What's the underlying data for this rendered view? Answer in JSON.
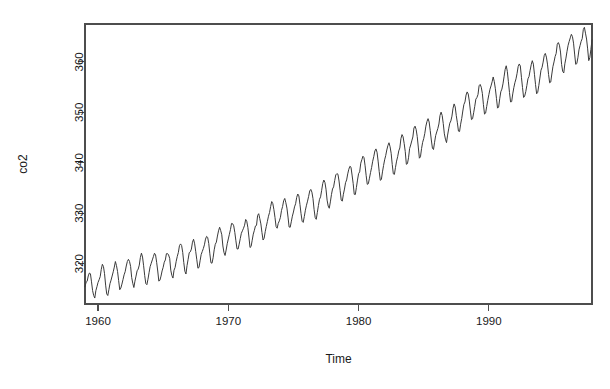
{
  "chart_data": {
    "type": "line",
    "title": "",
    "subtitle": "",
    "xlabel": "Time",
    "ylabel": "co2",
    "xlim": [
      1959.0,
      1997.917
    ],
    "ylim": [
      312.0,
      367.5
    ],
    "xticks": [
      1960,
      1970,
      1980,
      1990
    ],
    "xtick_labels": [
      "1960",
      "1970",
      "1980",
      "1990"
    ],
    "yticks": [
      320,
      330,
      340,
      350,
      360
    ],
    "ytick_labels": [
      "320",
      "330",
      "340",
      "350",
      "360"
    ],
    "grid": false,
    "legend": "none",
    "series_name": "co2",
    "series_color": "#3a3a3a",
    "frequency": "monthly",
    "x_start": 1959.0,
    "x_step": 0.0833333,
    "n_points": 468,
    "units": "ppm",
    "values": [
      315.42,
      316.31,
      316.5,
      317.56,
      318.13,
      318.0,
      316.39,
      314.65,
      313.68,
      313.18,
      314.66,
      315.43,
      316.27,
      316.81,
      317.42,
      318.87,
      319.87,
      319.43,
      318.01,
      315.74,
      314.0,
      313.68,
      314.84,
      316.03,
      316.73,
      317.54,
      318.38,
      319.31,
      320.42,
      319.61,
      318.42,
      316.63,
      314.83,
      315.16,
      315.94,
      316.85,
      317.78,
      318.4,
      319.53,
      320.42,
      320.85,
      320.45,
      319.45,
      317.25,
      316.11,
      315.27,
      316.53,
      317.53,
      318.58,
      318.92,
      319.7,
      321.22,
      322.08,
      321.31,
      319.58,
      317.61,
      316.05,
      315.83,
      316.91,
      318.2,
      319.41,
      320.07,
      320.74,
      321.4,
      322.06,
      321.73,
      320.27,
      318.54,
      316.54,
      316.71,
      317.53,
      318.55,
      319.27,
      320.28,
      320.73,
      321.97,
      322.0,
      321.71,
      321.05,
      318.71,
      317.66,
      317.14,
      318.7,
      319.25,
      320.46,
      321.43,
      322.23,
      323.54,
      323.91,
      323.59,
      322.24,
      320.2,
      318.48,
      317.94,
      319.63,
      320.87,
      322.17,
      322.34,
      322.88,
      324.25,
      324.83,
      323.93,
      322.38,
      320.76,
      319.1,
      319.24,
      320.56,
      321.8,
      322.4,
      322.99,
      323.73,
      324.86,
      325.4,
      325.2,
      323.98,
      321.95,
      320.18,
      320.09,
      321.16,
      322.74,
      323.83,
      324.26,
      325.47,
      326.5,
      327.21,
      326.54,
      325.72,
      323.5,
      322.22,
      321.62,
      322.69,
      323.95,
      324.89,
      325.82,
      326.77,
      327.97,
      327.91,
      327.5,
      326.18,
      324.53,
      322.93,
      322.9,
      323.85,
      324.96,
      326.01,
      326.51,
      327.01,
      327.62,
      328.76,
      328.4,
      327.2,
      325.27,
      323.2,
      323.4,
      324.63,
      325.85,
      326.6,
      327.47,
      327.58,
      329.56,
      329.9,
      328.92,
      327.88,
      326.16,
      324.68,
      325.04,
      326.34,
      327.39,
      328.37,
      329.4,
      330.14,
      331.33,
      332.31,
      331.9,
      330.7,
      329.15,
      327.35,
      327.02,
      327.99,
      328.48,
      329.18,
      330.55,
      331.32,
      332.48,
      332.92,
      332.08,
      331.01,
      329.23,
      327.27,
      327.21,
      328.29,
      329.41,
      330.23,
      331.25,
      331.87,
      333.14,
      333.8,
      333.43,
      331.73,
      329.9,
      328.4,
      328.17,
      329.32,
      330.59,
      331.58,
      332.39,
      333.33,
      334.41,
      334.71,
      334.17,
      332.89,
      330.77,
      329.14,
      328.78,
      330.14,
      331.52,
      332.75,
      333.24,
      334.53,
      335.9,
      336.57,
      336.1,
      334.76,
      332.59,
      331.42,
      330.98,
      332.24,
      333.68,
      334.8,
      335.22,
      336.47,
      337.59,
      337.84,
      337.72,
      336.37,
      334.51,
      332.6,
      332.38,
      333.75,
      334.78,
      336.05,
      336.59,
      337.79,
      338.71,
      339.3,
      339.12,
      337.56,
      335.92,
      333.75,
      333.7,
      335.12,
      336.56,
      337.84,
      338.19,
      339.91,
      340.6,
      341.29,
      341.0,
      339.39,
      337.43,
      335.72,
      335.84,
      336.93,
      338.04,
      339.06,
      340.3,
      341.21,
      342.33,
      342.74,
      342.08,
      340.32,
      338.26,
      336.52,
      336.68,
      338.19,
      339.44,
      340.57,
      341.44,
      342.53,
      343.39,
      343.96,
      343.18,
      341.88,
      339.65,
      337.81,
      337.69,
      339.09,
      340.32,
      341.2,
      342.35,
      342.93,
      344.77,
      345.58,
      345.14,
      343.81,
      342.21,
      339.69,
      339.82,
      340.98,
      342.82,
      343.52,
      344.33,
      345.11,
      346.88,
      347.25,
      346.62,
      345.22,
      343.11,
      340.9,
      341.18,
      342.8,
      344.04,
      344.79,
      345.82,
      347.25,
      348.17,
      348.74,
      348.07,
      346.38,
      344.51,
      342.92,
      342.62,
      344.06,
      345.38,
      346.11,
      346.78,
      347.68,
      349.37,
      350.03,
      349.37,
      347.76,
      345.73,
      344.68,
      343.99,
      345.48,
      346.72,
      347.84,
      348.29,
      349.23,
      350.8,
      351.66,
      351.07,
      349.33,
      347.92,
      346.27,
      346.18,
      347.64,
      348.78,
      350.25,
      351.54,
      352.05,
      353.41,
      354.04,
      353.62,
      352.22,
      350.27,
      348.55,
      348.72,
      349.91,
      351.18,
      352.6,
      352.92,
      353.53,
      355.26,
      355.52,
      354.97,
      353.75,
      351.52,
      349.64,
      349.83,
      351.14,
      352.37,
      353.5,
      354.55,
      355.23,
      356.04,
      357.0,
      356.07,
      354.67,
      352.76,
      350.82,
      351.04,
      352.69,
      354.07,
      354.59,
      355.63,
      357.03,
      358.48,
      359.22,
      358.12,
      356.06,
      353.92,
      352.05,
      352.11,
      353.64,
      354.89,
      355.88,
      356.63,
      357.72,
      359.07,
      359.58,
      359.17,
      356.94,
      354.92,
      352.94,
      353.23,
      354.09,
      355.33,
      356.63,
      357.1,
      358.32,
      359.41,
      360.23,
      359.55,
      357.53,
      355.48,
      353.67,
      353.95,
      355.3,
      356.78,
      358.34,
      358.89,
      359.95,
      361.25,
      361.67,
      360.94,
      359.55,
      357.49,
      355.84,
      356.0,
      357.59,
      359.05,
      359.98,
      361.03,
      361.66,
      363.48,
      363.82,
      363.3,
      361.94,
      359.5,
      358.11,
      357.8,
      359.61,
      360.74,
      362.09,
      363.29,
      364.06,
      364.76,
      365.45,
      365.01,
      363.7,
      361.54,
      359.51,
      359.65,
      360.8,
      362.38,
      363.23,
      364.06,
      364.61,
      366.4,
      366.84,
      365.68,
      364.52,
      362.57,
      360.24,
      360.83,
      362.49,
      364.34
    ]
  },
  "plot_geometry": {
    "box_left": 85,
    "box_right": 592,
    "box_top": 24,
    "box_bottom": 304,
    "tick_length": 7
  }
}
